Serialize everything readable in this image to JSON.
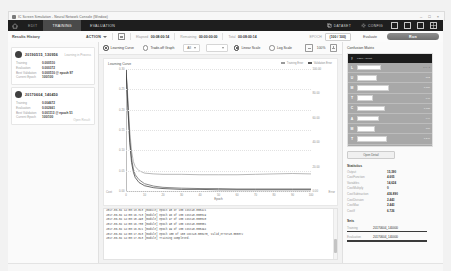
{
  "window": {
    "title": "IC Screen Simulation - Neural Network Console (Window)",
    "minimize": "–",
    "maximize": "□",
    "close": "×"
  },
  "nav": {
    "home_icon": "home-icon",
    "tabs": [
      {
        "label": "EDIT",
        "state": "dim"
      },
      {
        "label": "TRAINING",
        "state": "active"
      },
      {
        "label": "EVALUATION",
        "state": "normal"
      }
    ],
    "actions": [
      {
        "label": "DATASET",
        "icon": "dataset-icon"
      },
      {
        "label": "CONFIG",
        "icon": "gear-icon"
      }
    ],
    "panel_icons": [
      "panel-left-icon",
      "panel-bottom-icon",
      "panel-right-icon",
      "panel-grid-icon"
    ]
  },
  "toolbar": {
    "title": "Results History",
    "action_label": "ACTION",
    "save_icon": "save-icon",
    "fields": [
      {
        "key": "Elapsed",
        "value": "00:08:00:14"
      },
      {
        "key": "Remaining",
        "value": "00:00:00:00"
      },
      {
        "key": "Total",
        "value": "00:08:00:14"
      }
    ],
    "epoch_label": "EPOCH",
    "epoch_value": "(100 / 100)",
    "evaluate_label": "Evaluate",
    "run_label": "Run"
  },
  "sidebar": {
    "results": [
      {
        "name": "20190515_130956",
        "tag": "Learning in Process",
        "rows": [
          {
            "key": "Training",
            "value": "0.000510"
          },
          {
            "key": "Evaluation",
            "value": "0.000372"
          },
          {
            "key": "Best Validation",
            "value": "0.000510 @ epoch 97"
          },
          {
            "key": "Current Epoch",
            "value": "100/100"
          }
        ],
        "link": ""
      },
      {
        "name": "20170604_140450",
        "tag": "",
        "rows": [
          {
            "key": "Training",
            "value": "0.004672"
          },
          {
            "key": "Evaluation",
            "value": "0.002661"
          },
          {
            "key": "Best Validation",
            "value": "0.001113 @ epoch 51"
          },
          {
            "key": "Current Epoch",
            "value": "100/100"
          }
        ],
        "link": "Open Result"
      }
    ]
  },
  "chart_controls": {
    "view_modes": [
      {
        "label": "Learning Curve",
        "selected": true
      },
      {
        "label": "Trade-off Graph",
        "selected": false
      }
    ],
    "selects": [
      {
        "value": "All"
      },
      {
        "value": ""
      }
    ],
    "scales": [
      {
        "label": "Linear Scale",
        "selected": true
      },
      {
        "label": "Log Scale",
        "selected": false
      }
    ],
    "zoom_out_icon": "zoom-out-icon",
    "zoom_in_icon": "zoom-in-icon",
    "zoom_level": "100%"
  },
  "chart_data": {
    "type": "line",
    "title": "Learning Curve",
    "xlabel": "Epoch",
    "ylabel": "Cost",
    "ylabel_right": "Error",
    "grid": true,
    "legend_position": "top-right",
    "xlim": [
      0,
      100
    ],
    "ylim": [
      0,
      0.3
    ],
    "xticks": [
      0,
      10,
      20,
      30,
      40,
      50,
      60,
      70,
      80,
      90,
      100
    ],
    "yticks": [
      0.0,
      0.05,
      0.1,
      0.15,
      0.2,
      0.25,
      0.3
    ],
    "yticks_right": [
      "0.00",
      "20.00",
      "40.00",
      "60.00",
      "80.00",
      "100.00"
    ],
    "series": [
      {
        "name": "Training Error",
        "color": "#9a9a9a",
        "x": [
          0,
          1,
          2,
          3,
          4,
          5,
          7,
          10,
          15,
          20,
          30,
          40,
          50,
          60,
          70,
          80,
          90,
          100
        ],
        "y": [
          0.3,
          0.23,
          0.15,
          0.098,
          0.072,
          0.06,
          0.05,
          0.044,
          0.042,
          0.041,
          0.041,
          0.04,
          0.04,
          0.04,
          0.041,
          0.042,
          0.043,
          0.042
        ]
      },
      {
        "name": "Validation Error",
        "color": "#5a5a5a",
        "x": [
          0,
          1,
          2,
          3,
          4,
          5,
          7,
          10,
          15,
          20,
          30,
          40,
          50,
          60,
          70,
          80,
          90,
          100
        ],
        "y": [
          0.3,
          0.215,
          0.13,
          0.08,
          0.054,
          0.04,
          0.028,
          0.018,
          0.012,
          0.009,
          0.007,
          0.006,
          0.006,
          0.005,
          0.005,
          0.005,
          0.005,
          0.005
        ]
      },
      {
        "name": "Cost",
        "color": "#2f2f2f",
        "x": [
          0,
          1,
          2,
          3,
          4,
          5,
          7,
          10,
          15,
          20,
          30,
          40,
          50,
          60,
          70,
          80,
          90,
          100
        ],
        "y": [
          0.3,
          0.205,
          0.12,
          0.07,
          0.046,
          0.033,
          0.021,
          0.013,
          0.008,
          0.006,
          0.004,
          0.004,
          0.003,
          0.003,
          0.003,
          0.003,
          0.003,
          0.003
        ]
      }
    ]
  },
  "log": {
    "lines": [
      "2017-06-04 14:00:13.013 [module] epoch 95 of 100 cost=0.000421",
      "2017-06-04 14:00:16.713 [module] epoch 96 of 100 cost=0.000519",
      "2017-06-04 14:00:18.498 [module] epoch 97 of 100 cost=0.000510",
      "2017-06-04 14:00:16.730 [module] epoch 98 of 100 cost=0.000501",
      "2017-06-04 14:00:16.021 [module] epoch 99 of 100 cost=0.000494",
      "2017-06-04 14:00:17.013 [module] epoch 100 of 100 cost=0.000470, valid_error=0.000372",
      "2017-06-04 14:00:17.013 [module] Training Completed."
    ],
    "scrollbar": "log-scrollbar"
  },
  "right": {
    "confusion_title": "Confusion Matrix",
    "matrix_header": {
      "col1": "y",
      "col2": "Label / Count"
    },
    "matrix_note": "Count",
    "rows": [
      {
        "label": "L",
        "bar": 22,
        "value": "1,024"
      },
      {
        "label": "U",
        "bar": 18,
        "value": "892"
      },
      {
        "label": "M",
        "bar": 30,
        "value": "1,310"
      },
      {
        "label": "T",
        "bar": 14,
        "value": "640"
      },
      {
        "label": "C",
        "bar": 26,
        "value": "1,188"
      },
      {
        "label": "A",
        "bar": 20,
        "value": "944"
      },
      {
        "label": "M",
        "bar": 16,
        "value": "760"
      },
      {
        "label": "T",
        "bar": 28,
        "value": "1,246"
      },
      {
        "label": "A",
        "bar": 12,
        "value": "528"
      },
      {
        "label": "E",
        "bar": 24,
        "value": "1,092"
      }
    ],
    "open_button": "Open Detail",
    "stats_title": "Statistics",
    "stats": [
      {
        "key": "Output",
        "value": "15,390"
      },
      {
        "key": "CostFunction",
        "value": "4.605"
      },
      {
        "key": "Variables",
        "value": "14,624"
      },
      {
        "key": "CostMultiply",
        "value": "0"
      },
      {
        "key": "CostSubtraction",
        "value": "436.890"
      },
      {
        "key": "CostDivision",
        "value": "2.443"
      },
      {
        "key": "CostMax",
        "value": "2.443"
      },
      {
        "key": "CostIf",
        "value": "6.726"
      }
    ],
    "sets_title": "Sets",
    "sets": [
      {
        "key": "Training",
        "value": "20170604_140000"
      },
      {
        "key": "Evaluation",
        "value": "20170604_140000"
      }
    ]
  }
}
